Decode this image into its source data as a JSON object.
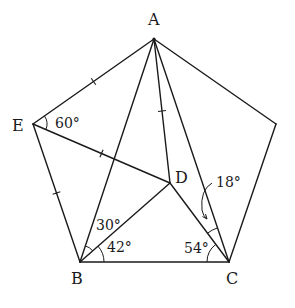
{
  "figure": {
    "type": "geometry",
    "points": {
      "A": {
        "label": "A"
      },
      "B": {
        "label": "B"
      },
      "C": {
        "label": "C"
      },
      "D": {
        "label": "D"
      },
      "E": {
        "label": "E"
      },
      "F": {
        "label": ""
      }
    },
    "segments": [
      {
        "from": "A",
        "to": "E",
        "marked": true
      },
      {
        "from": "E",
        "to": "B",
        "marked": true
      },
      {
        "from": "B",
        "to": "C",
        "marked": false
      },
      {
        "from": "C",
        "to": "F",
        "marked": false
      },
      {
        "from": "F",
        "to": "A",
        "marked": false
      },
      {
        "from": "A",
        "to": "B",
        "marked": false
      },
      {
        "from": "A",
        "to": "D",
        "marked": true
      },
      {
        "from": "A",
        "to": "C",
        "marked": false
      },
      {
        "from": "E",
        "to": "D",
        "marked": true
      },
      {
        "from": "B",
        "to": "D",
        "marked": false
      },
      {
        "from": "D",
        "to": "C",
        "marked": false
      }
    ],
    "angles": [
      {
        "vertex": "E",
        "between": [
          "A",
          "D"
        ],
        "value": "60°"
      },
      {
        "vertex": "B",
        "between": [
          "A",
          "D"
        ],
        "value": "30°"
      },
      {
        "vertex": "B",
        "between": [
          "D",
          "C"
        ],
        "value": "42°"
      },
      {
        "vertex": "C",
        "between": [
          "B",
          "D"
        ],
        "value": "54°"
      },
      {
        "vertex": "C",
        "between": [
          "D",
          "A"
        ],
        "value": "18°",
        "pointer": true
      }
    ]
  }
}
